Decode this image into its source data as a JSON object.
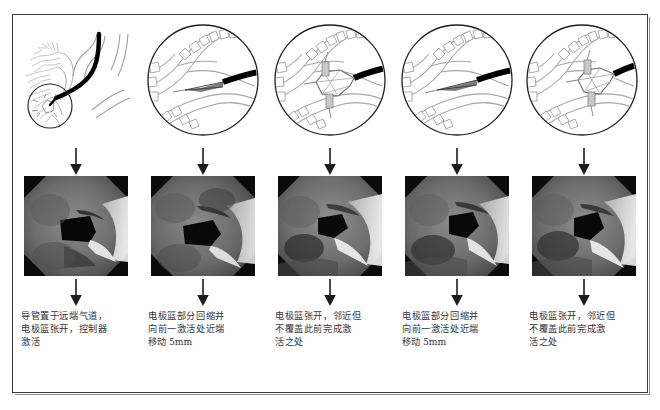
{
  "figure": {
    "kind": "medical-procedure-sequence-figure",
    "panel_count": 5,
    "border_color": "#3a3a3c",
    "background_color": "#ffffff",
    "text_color": "#34343a"
  },
  "panels": [
    {
      "id": "panel-1",
      "illustration": {
        "type": "bronchial-tree-overview",
        "name": "airway-overview-diagram",
        "has_magnifier_circle": true,
        "catheter_color": "#000000"
      },
      "photo": {
        "type": "bronchoscopy-photograph",
        "name": "bronchoscopic-view-1"
      },
      "caption_lines": [
        "导管置于远端气道，",
        "电极篮张开，控制器",
        "激活"
      ]
    },
    {
      "id": "panel-2",
      "illustration": {
        "type": "magnified-airway-circle",
        "name": "airway-magnified-diagram",
        "basket_state": "retracted",
        "catheter_color": "#000000"
      },
      "photo": {
        "type": "bronchoscopy-photograph",
        "name": "bronchoscopic-view-2"
      },
      "caption_lines": [
        "电极篮部分回缩并",
        "向前一激活处近端",
        "移动 5mm"
      ]
    },
    {
      "id": "panel-3",
      "illustration": {
        "type": "magnified-airway-circle",
        "name": "airway-magnified-diagram",
        "basket_state": "expanded",
        "catheter_color": "#000000"
      },
      "photo": {
        "type": "bronchoscopy-photograph",
        "name": "bronchoscopic-view-3"
      },
      "caption_lines": [
        "电极篮张开，邻近但",
        "不覆盖此前完成激",
        "活之处"
      ]
    },
    {
      "id": "panel-4",
      "illustration": {
        "type": "magnified-airway-circle",
        "name": "airway-magnified-diagram",
        "basket_state": "retracted",
        "catheter_color": "#000000"
      },
      "photo": {
        "type": "bronchoscopy-photograph",
        "name": "bronchoscopic-view-4"
      },
      "caption_lines": [
        "电极篮部分回缩并",
        "向前一激活处近端",
        "移动 5mm"
      ]
    },
    {
      "id": "panel-5",
      "illustration": {
        "type": "magnified-airway-circle",
        "name": "airway-magnified-diagram",
        "basket_state": "expanded",
        "catheter_color": "#000000"
      },
      "photo": {
        "type": "bronchoscopy-photograph",
        "name": "bronchoscopic-view-5"
      },
      "caption_lines": [
        "电极篮张开，邻近但",
        "不覆盖此前完成激",
        "活之处"
      ]
    }
  ]
}
